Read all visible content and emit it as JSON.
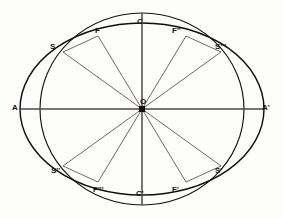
{
  "figure": {
    "background_color": "#fdfdfb",
    "ink_color": "#15130f",
    "center": {
      "x": 142,
      "y": 109
    },
    "wide_ellipse": {
      "semi_x": 122,
      "semi_y": 86,
      "role": "horizontal major axis through A and A-prime"
    },
    "tall_ellipse": {
      "semi_x": 102,
      "semi_y": 96,
      "role": "vertical major axis through C and C-prime"
    }
  },
  "labels": {
    "center": "O",
    "left_vertex": "A",
    "right_vertex": "A'",
    "top_vertex": "C",
    "bottom_vertex": "C'",
    "upper_left_intersection": "S",
    "upper_right_intersection": "S'''",
    "lower_left_intersection": "S''",
    "lower_right_intersection": "S'",
    "focus_upper_left": "F",
    "focus_upper_right": "F''",
    "focus_lower_left": "F'''",
    "focus_lower_right": "F'"
  },
  "label_positions": {
    "center": {
      "x": 140,
      "y": 98
    },
    "left_vertex": {
      "x": 12,
      "y": 104
    },
    "right_vertex": {
      "x": 262,
      "y": 104
    },
    "top_vertex": {
      "x": 137,
      "y": 18
    },
    "bottom_vertex": {
      "x": 136,
      "y": 190
    },
    "upper_left_intersection": {
      "x": 50,
      "y": 43
    },
    "upper_right_intersection": {
      "x": 215,
      "y": 43
    },
    "lower_left_intersection": {
      "x": 51,
      "y": 167
    },
    "lower_right_intersection": {
      "x": 215,
      "y": 167
    },
    "focus_upper_left": {
      "x": 95,
      "y": 27
    },
    "focus_upper_right": {
      "x": 172,
      "y": 27
    },
    "focus_lower_left": {
      "x": 93,
      "y": 186
    },
    "focus_lower_right": {
      "x": 172,
      "y": 186
    }
  },
  "geometry_points": {
    "center": {
      "x": 142,
      "y": 109
    },
    "A": {
      "x": 20,
      "y": 109
    },
    "A_prime": {
      "x": 264,
      "y": 109
    },
    "C": {
      "x": 142,
      "y": 13
    },
    "C_prime": {
      "x": 142,
      "y": 205
    },
    "S": {
      "x": 63,
      "y": 52
    },
    "S_triple_prime": {
      "x": 221,
      "y": 52
    },
    "S_double_prime": {
      "x": 63,
      "y": 166
    },
    "S_prime": {
      "x": 221,
      "y": 166
    },
    "F": {
      "x": 98,
      "y": 36
    },
    "F_double_prime": {
      "x": 186,
      "y": 36
    },
    "F_triple_prime": {
      "x": 98,
      "y": 182
    },
    "F_prime": {
      "x": 186,
      "y": 182
    }
  }
}
